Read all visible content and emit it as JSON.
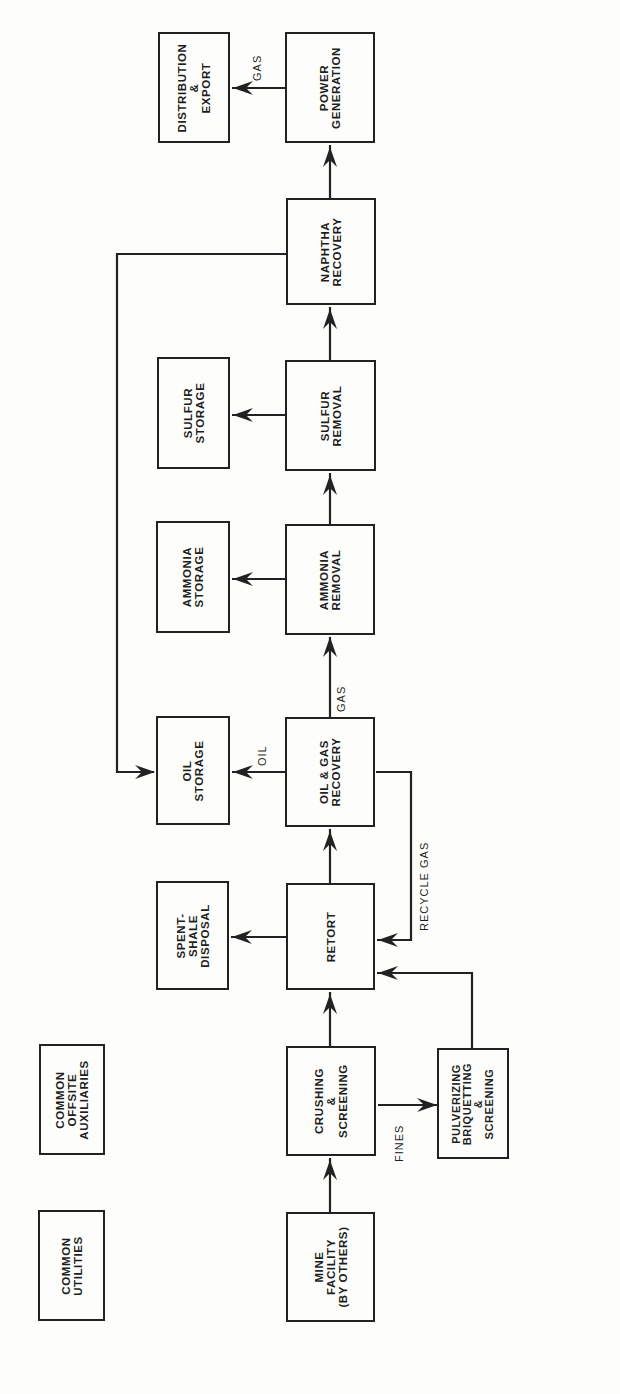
{
  "diagram": {
    "orientation": "rotated 90 degrees counter-clockwise (flow runs bottom to top)",
    "blocks": [
      {
        "id": "mine_facility",
        "label": "MINE\nFACILITY\n(BY OTHERS)"
      },
      {
        "id": "crushing_screening",
        "label": "CRUSHING\n&\nSCREENING"
      },
      {
        "id": "pulverizing",
        "label": "PULVERIZING\nBRIQUETTING\n&\nSCREENING"
      },
      {
        "id": "retort",
        "label": "RETORT"
      },
      {
        "id": "spent_shale_disposal",
        "label": "SPENT-\nSHALE\nDISPOSAL"
      },
      {
        "id": "oil_gas_recovery",
        "label": "OIL & GAS\nRECOVERY"
      },
      {
        "id": "oil_storage",
        "label": "OIL\nSTORAGE"
      },
      {
        "id": "ammonia_removal",
        "label": "AMMONIA\nREMOVAL"
      },
      {
        "id": "ammonia_storage",
        "label": "AMMONIA\nSTORAGE"
      },
      {
        "id": "sulfur_removal",
        "label": "SULFUR\nREMOVAL"
      },
      {
        "id": "sulfur_storage",
        "label": "SULFUR\nSTORAGE"
      },
      {
        "id": "naphtha_recovery",
        "label": "NAPHTHA\nRECOVERY"
      },
      {
        "id": "power_generation",
        "label": "POWER\nGENERATION"
      },
      {
        "id": "distribution_export",
        "label": "DISTRIBUTION\n&\nEXPORT"
      },
      {
        "id": "common_utilities",
        "label": "COMMON\nUTILITIES"
      },
      {
        "id": "common_offsite_auxiliaries",
        "label": "COMMON\nOFFSITE\nAUXILIARIES"
      }
    ],
    "flow_labels": {
      "fines": "FINES",
      "recycle_gas": "RECYCLE GAS",
      "oil": "OIL",
      "gas_main": "GAS",
      "gas_export": "GAS"
    },
    "edges": [
      {
        "from": "mine_facility",
        "to": "crushing_screening"
      },
      {
        "from": "crushing_screening",
        "to": "retort"
      },
      {
        "from": "crushing_screening",
        "to": "pulverizing",
        "label": "FINES"
      },
      {
        "from": "pulverizing",
        "to": "retort"
      },
      {
        "from": "retort",
        "to": "spent_shale_disposal"
      },
      {
        "from": "retort",
        "to": "oil_gas_recovery"
      },
      {
        "from": "oil_gas_recovery",
        "to": "retort",
        "label": "RECYCLE GAS"
      },
      {
        "from": "oil_gas_recovery",
        "to": "oil_storage",
        "label": "OIL"
      },
      {
        "from": "oil_gas_recovery",
        "to": "ammonia_removal",
        "label": "GAS"
      },
      {
        "from": "ammonia_removal",
        "to": "ammonia_storage"
      },
      {
        "from": "ammonia_removal",
        "to": "sulfur_removal"
      },
      {
        "from": "sulfur_removal",
        "to": "sulfur_storage"
      },
      {
        "from": "sulfur_removal",
        "to": "naphtha_recovery"
      },
      {
        "from": "naphtha_recovery",
        "to": "oil_storage"
      },
      {
        "from": "naphtha_recovery",
        "to": "power_generation"
      },
      {
        "from": "power_generation",
        "to": "distribution_export",
        "label": "GAS"
      }
    ]
  }
}
